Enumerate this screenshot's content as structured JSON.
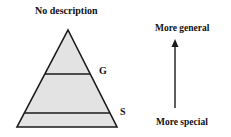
{
  "diagram": {
    "title": "No description",
    "pyramid": {
      "fill_color": "#e3e3e3",
      "stroke_color": "#1a1a1a",
      "levels": [
        {
          "label": "G",
          "position": "upper divider"
        },
        {
          "label": "S",
          "position": "lower divider"
        }
      ]
    },
    "arrow": {
      "direction": "up",
      "top_label": "More general",
      "bottom_label": "More special"
    }
  }
}
